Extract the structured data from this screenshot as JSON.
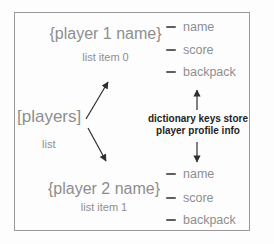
{
  "diagram": {
    "player1": {
      "title": "{player 1 name}",
      "subtitle": "list item 0",
      "keys": [
        "name",
        "score",
        "backpack"
      ]
    },
    "player2": {
      "title": "{player 2 name}",
      "subtitle": "list item 1",
      "keys": [
        "name",
        "score",
        "backpack"
      ]
    },
    "players_list": {
      "title": "[players]",
      "subtitle": "list"
    },
    "annotation": {
      "line1": "dictionary keys store",
      "line2": "player profile info"
    }
  },
  "colors": {
    "text_gray": "#8e8e8e",
    "annotation_black": "#1f1f1f",
    "arrow": "#2f2f2f",
    "frame_border": "#999999",
    "background": "#fdfdfd",
    "tick": "#5f5f5f"
  }
}
